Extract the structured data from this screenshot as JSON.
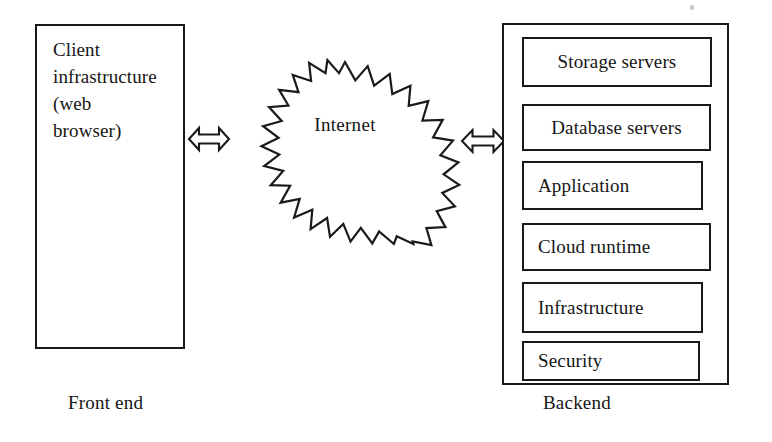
{
  "diagram": {
    "type": "architecture-block-diagram",
    "frontend": {
      "box_text": "Client\ninfrastructure\n(web\nbrowser)",
      "caption": "Front end"
    },
    "network": {
      "label": "Internet",
      "shape": "starburst"
    },
    "connectors": {
      "left_arrow": "double-headed-arrow",
      "right_arrow": "double-headed-arrow"
    },
    "backend": {
      "caption": "Backend",
      "layers": [
        {
          "label": "Storage servers",
          "align": "center"
        },
        {
          "label": "Database servers",
          "align": "center"
        },
        {
          "label": "Application",
          "align": "left"
        },
        {
          "label": "Cloud runtime",
          "align": "left"
        },
        {
          "label": "Infrastructure",
          "align": "left"
        },
        {
          "label": "Security",
          "align": "left"
        }
      ]
    },
    "colors": {
      "stroke": "#1a1a1a",
      "text": "#151515",
      "background": "#ffffff"
    }
  }
}
